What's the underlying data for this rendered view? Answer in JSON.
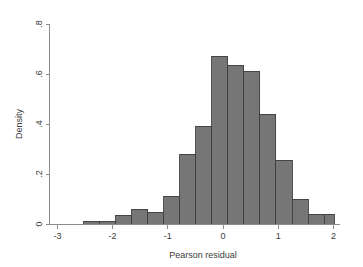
{
  "chart_data": {
    "type": "bar",
    "title": "",
    "subtitle": "",
    "xlabel": "Pearson residual",
    "ylabel": "Density",
    "xlim": [
      -3.0,
      2.1
    ],
    "ylim": [
      0,
      0.8
    ],
    "xticks": [
      -3,
      -2,
      -1,
      0,
      1,
      2
    ],
    "xtick_labels": [
      "-3",
      "-2",
      "-1",
      "0",
      "1",
      "2"
    ],
    "yticks": [
      0,
      0.2,
      0.4,
      0.6,
      0.8
    ],
    "ytick_labels": [
      "0",
      ".2",
      ".4",
      ".6",
      ".8"
    ],
    "grid": false,
    "legend": null,
    "bin_width": 0.29,
    "bar_color": "#767676",
    "bar_edge_color": "#3f3f3f",
    "axis_color": "#8d8d8d",
    "background_color": "#ffffff",
    "bins": [
      {
        "x_left": -2.52,
        "x_right": -2.23,
        "center": -2.375,
        "density": 0.012
      },
      {
        "x_left": -2.23,
        "x_right": -1.94,
        "center": -2.085,
        "density": 0.012
      },
      {
        "x_left": -1.94,
        "x_right": -1.65,
        "center": -1.795,
        "density": 0.036
      },
      {
        "x_left": -1.65,
        "x_right": -1.36,
        "center": -1.505,
        "density": 0.06
      },
      {
        "x_left": -1.36,
        "x_right": -1.07,
        "center": -1.215,
        "density": 0.048
      },
      {
        "x_left": -1.07,
        "x_right": -0.78,
        "center": -0.925,
        "density": 0.112
      },
      {
        "x_left": -0.78,
        "x_right": -0.49,
        "center": -0.635,
        "density": 0.28
      },
      {
        "x_left": -0.49,
        "x_right": -0.2,
        "center": -0.345,
        "density": 0.392
      },
      {
        "x_left": -0.2,
        "x_right": 0.09,
        "center": -0.055,
        "density": 0.672
      },
      {
        "x_left": 0.09,
        "x_right": 0.38,
        "center": 0.235,
        "density": 0.636
      },
      {
        "x_left": 0.38,
        "x_right": 0.67,
        "center": 0.525,
        "density": 0.612
      },
      {
        "x_left": 0.67,
        "x_right": 0.96,
        "center": 0.815,
        "density": 0.44
      },
      {
        "x_left": 0.96,
        "x_right": 1.25,
        "center": 1.105,
        "density": 0.256
      },
      {
        "x_left": 1.25,
        "x_right": 1.54,
        "center": 1.395,
        "density": 0.1
      },
      {
        "x_left": 1.54,
        "x_right": 1.83,
        "center": 1.685,
        "density": 0.04
      },
      {
        "x_left": 1.83,
        "x_right": 2.12,
        "center": 1.975,
        "density": 0.04
      },
      {
        "x_left": 2.12,
        "x_right": 2.41,
        "center": 2.265,
        "density": 0.072
      }
    ],
    "values": [
      0.012,
      0.012,
      0.036,
      0.06,
      0.048,
      0.112,
      0.28,
      0.392,
      0.672,
      0.636,
      0.612,
      0.44,
      0.256,
      0.1,
      0.04,
      0.04,
      0.072
    ],
    "categories": [
      "-2.375",
      "-2.085",
      "-1.795",
      "-1.505",
      "-1.215",
      "-0.925",
      "-0.635",
      "-0.345",
      "-0.055",
      "0.235",
      "0.525",
      "0.815",
      "1.105",
      "1.395",
      "1.685",
      "1.975",
      "2.265"
    ]
  }
}
